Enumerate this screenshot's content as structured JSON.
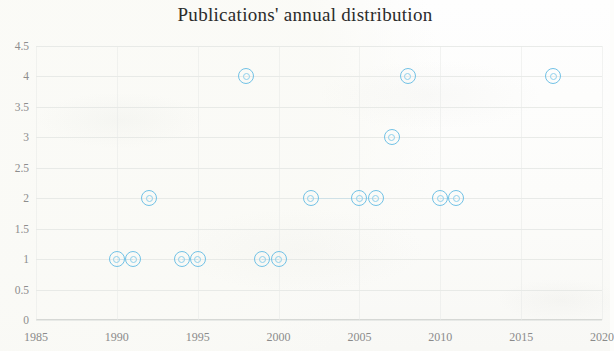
{
  "chart_data": {
    "type": "scatter",
    "title": "Publications' annual distribution",
    "xlabel": "",
    "ylabel": "",
    "grid": true,
    "legend": "none",
    "marker_color": "#72c2e6",
    "xlim": [
      1985,
      2020
    ],
    "ylim": [
      0,
      4.5
    ],
    "xticks": [
      "1985",
      "1990",
      "1995",
      "2000",
      "2005",
      "2010",
      "2015",
      "2020"
    ],
    "xtick_values": [
      1985,
      1990,
      1995,
      2000,
      2005,
      2010,
      2015,
      2020
    ],
    "yticks": [
      "0",
      "0.5",
      "1",
      "1.5",
      "2",
      "2.5",
      "3",
      "3.5",
      "4",
      "4.5"
    ],
    "ytick_values": [
      0,
      0.5,
      1,
      1.5,
      2,
      2.5,
      3,
      3.5,
      4,
      4.5
    ],
    "x": [
      1990,
      1991,
      1992,
      1994,
      1995,
      1998,
      1999,
      2000,
      2002,
      2005,
      2006,
      2007,
      2008,
      2010,
      2011,
      2017
    ],
    "y": [
      1,
      1,
      2,
      1,
      1,
      4,
      1,
      1,
      2,
      2,
      2,
      3,
      4,
      2,
      2,
      4
    ],
    "points": [
      {
        "year": 1990,
        "count": 1
      },
      {
        "year": 1991,
        "count": 1
      },
      {
        "year": 1992,
        "count": 2
      },
      {
        "year": 1994,
        "count": 1
      },
      {
        "year": 1995,
        "count": 1
      },
      {
        "year": 1998,
        "count": 4
      },
      {
        "year": 1999,
        "count": 1
      },
      {
        "year": 2000,
        "count": 1
      },
      {
        "year": 2002,
        "count": 2
      },
      {
        "year": 2005,
        "count": 2
      },
      {
        "year": 2006,
        "count": 2
      },
      {
        "year": 2007,
        "count": 3
      },
      {
        "year": 2008,
        "count": 4
      },
      {
        "year": 2010,
        "count": 2
      },
      {
        "year": 2011,
        "count": 2
      },
      {
        "year": 2017,
        "count": 4
      }
    ]
  }
}
